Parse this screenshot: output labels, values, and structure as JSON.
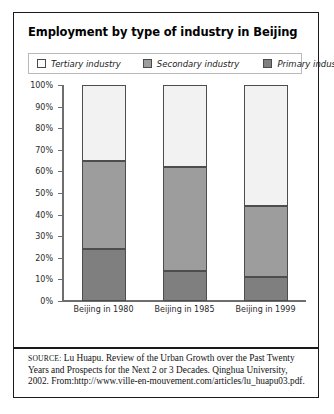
{
  "title": "Employment by type of industry in Beijing",
  "legend": {
    "items": [
      {
        "label": "Tertiary industry",
        "key": "tertiary",
        "color": "#fbfbfb"
      },
      {
        "label": "Secondary industry",
        "key": "secondary",
        "color": "#9d9d9d"
      },
      {
        "label": "Primary industry",
        "key": "primary",
        "color": "#7f7f7f"
      }
    ]
  },
  "axis": {
    "y_ticks": [
      "100%",
      "90%",
      "80%",
      "70%",
      "60%",
      "50%",
      "40%",
      "30%",
      "20%",
      "10%",
      "0%"
    ]
  },
  "source": {
    "prefix": "SOURCE:",
    "text": " Lu Huapu. Review of the Urban Growth over the Past Twenty Years and Prospects for the Next 2 or 3 Decades. Qinghua University, 2002. From:http://www.ville-en-mouvement.com/articles/lu_huapu03.pdf."
  },
  "chart_data": {
    "type": "bar",
    "subtype": "stacked-100-percent",
    "title": "Employment by type of industry in Beijing",
    "xlabel": "",
    "ylabel": "",
    "ylim": [
      0,
      100
    ],
    "yticks": [
      0,
      10,
      20,
      30,
      40,
      50,
      60,
      70,
      80,
      90,
      100
    ],
    "ytick_labels": [
      "0%",
      "10%",
      "20%",
      "30%",
      "40%",
      "50%",
      "60%",
      "70%",
      "80%",
      "90%",
      "100%"
    ],
    "grid": false,
    "legend_position": "top",
    "categories": [
      "Beijing in 1980",
      "Beijing in 1985",
      "Beijing in 1999"
    ],
    "stack_order_bottom_to_top": [
      "Primary industry",
      "Secondary industry",
      "Tertiary industry"
    ],
    "series": [
      {
        "name": "Primary industry",
        "color": "#7f7f7f",
        "values": [
          24,
          14,
          11
        ]
      },
      {
        "name": "Secondary industry",
        "color": "#9d9d9d",
        "values": [
          41,
          48,
          33
        ]
      },
      {
        "name": "Tertiary industry",
        "color": "#f2f2f2",
        "values": [
          35,
          38,
          56
        ]
      }
    ],
    "cumulative_tops": {
      "primary": [
        24,
        14,
        11
      ],
      "secondary": [
        65,
        62,
        44
      ],
      "tertiary": [
        100,
        100,
        100
      ]
    },
    "units": "percent of total employment"
  }
}
